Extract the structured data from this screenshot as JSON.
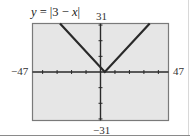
{
  "title": {
    "prefix": "y",
    "equals": " = |3 − ",
    "var": "x",
    "suffix": "|",
    "full": "y = |3 − x|"
  },
  "window": {
    "xmin_label": "−47",
    "xmax_label": "47",
    "ymin_label": "−31",
    "ymax_label": "31"
  },
  "colors": {
    "plot_bg": "#e6e6e6",
    "border": "#7a7a7a",
    "curve": "#2a2a2a"
  },
  "chart_data": {
    "type": "line",
    "title": "y = |3 − x|",
    "function": "y = |3 - x|",
    "xlabel": "",
    "ylabel": "",
    "xlim": [
      -47,
      47
    ],
    "ylim": [
      -31,
      31
    ],
    "xscale_ticks": 10,
    "yscale_ticks": 10,
    "tick_labels": {
      "x": [
        "−47",
        "47"
      ],
      "y": [
        "−31",
        "31"
      ]
    },
    "grid": false,
    "legend": null,
    "series": [
      {
        "name": "y = |3 − x|",
        "x": [
          -28,
          3,
          34
        ],
        "y": [
          31,
          0,
          31
        ]
      }
    ],
    "vertex": [
      3,
      0
    ]
  }
}
